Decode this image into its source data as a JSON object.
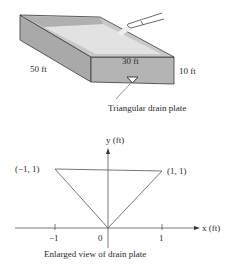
{
  "tank_figure": {
    "labels": {
      "length": "50 ft",
      "width": "30 ft",
      "height": "10 ft",
      "drain": "Triangular drain plate"
    },
    "colors": {
      "side_face": "#a9a9a9",
      "front_face": "#b4b4b4",
      "water_surface": "#dcdcdc",
      "outline": "#3a3a3a"
    }
  },
  "drain_plate_figure": {
    "caption": "Enlarged view of drain plate",
    "axes": {
      "x_label": "x (ft)",
      "y_label": "y (ft)",
      "x_ticks": [
        "−1",
        "0",
        "1"
      ]
    },
    "vertices": {
      "left": "(−1, 1)",
      "right": "(1, 1)",
      "origin": "(0, 0)"
    }
  }
}
